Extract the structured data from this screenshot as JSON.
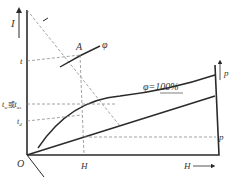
{
  "diagram": {
    "type": "I-H psychrometric diagram",
    "axes": {
      "vertical_label": "I",
      "horizontal_label": "H",
      "origin_label": "O",
      "pressure_label": "p"
    },
    "points": {
      "A": "A"
    },
    "curves": {
      "phi": "φ",
      "phi_saturated": "φ=100%"
    },
    "temperature_labels": {
      "t": "t",
      "tw_or_tas_prefix": "t",
      "tw_sub": "w",
      "or": "或",
      "tas_prefix": "t",
      "tas_sub": "as",
      "td_prefix": "t",
      "td_sub": "d"
    },
    "projections": {
      "H_at_A": "H",
      "p_at_H": "p"
    },
    "colors": {
      "line": "#2a2a2a",
      "dashed": "#8a8a8a",
      "text": "#333333",
      "background": "#ffffff"
    }
  }
}
